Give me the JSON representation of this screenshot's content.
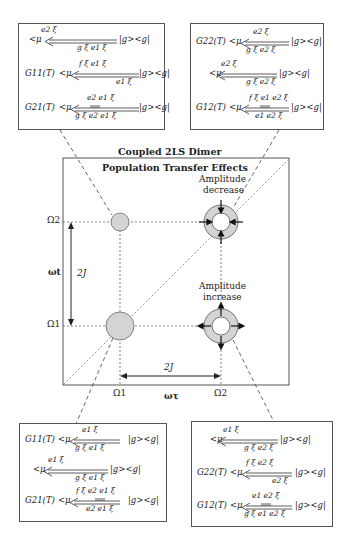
{
  "title": {
    "line1": "Coupled 2LS Dimer",
    "line2": "Population Transfer Effects"
  },
  "axes": {
    "x_label": "ωτ",
    "y_label": "ωt",
    "x_ticks": [
      "Ω1",
      "Ω2"
    ],
    "y_ticks": [
      "Ω1",
      "Ω2"
    ],
    "splitting_horizontal": "2J",
    "splitting_vertical": "2J"
  },
  "annotations": {
    "upper_right": [
      "Amplitude",
      "decrease"
    ],
    "lower_right": [
      "Amplitude",
      "increase"
    ]
  },
  "boxes": {
    "top_left": [
      {
        "prefix": "",
        "top": "e2 ξ",
        "bottom": "g ξ e1 ξ",
        "suffix": "|g><g|"
      },
      {
        "prefix": "G11(T)",
        "top": "f ξ e1 ξ",
        "bottom": "e1 ξ",
        "suffix": "|g><g|"
      },
      {
        "prefix": "G21(T)",
        "top": "e2  e1 ξ",
        "bottom": "g ξ e2  e1  ξ",
        "suffix": "|g><g|"
      }
    ],
    "top_right": [
      {
        "prefix": "G22(T)",
        "top": "e2 ξ",
        "bottom": "g ξ  e2 ξ",
        "suffix": "|g><g|"
      },
      {
        "prefix": "",
        "top": "e2 ξ",
        "bottom": "g ξ e2 ξ",
        "suffix": "|g><g|"
      },
      {
        "prefix": "G12(T)",
        "top": "f ξ e1  e2 ξ",
        "bottom": "e1  e2  ξ",
        "suffix": "|g><g|"
      }
    ],
    "bottom_left": [
      {
        "prefix": "G11(T)",
        "top": "e1 ξ",
        "bottom": "g ξ  e1  ξ",
        "suffix": "|g><g|"
      },
      {
        "prefix": "",
        "top": "e1 ξ",
        "bottom": "g ξ e1 ξ",
        "suffix": "|g><g|"
      },
      {
        "prefix": "G21(T)",
        "top": "f ξ e2  e1 ξ",
        "bottom": "e2  e1  ξ",
        "suffix": "|g><g|"
      }
    ],
    "bottom_right": [
      {
        "prefix": "",
        "top": "e1 ξ",
        "bottom": "g ξ e2 ξ",
        "suffix": "|g><g|"
      },
      {
        "prefix": "G22(T)",
        "top": "f ξ e2 ξ",
        "bottom": "e2 ξ",
        "suffix": "|g><g|"
      },
      {
        "prefix": "G12(T)",
        "top": "e1  e2 ξ",
        "bottom": "g ξ e1  e2  ξ",
        "suffix": "|g><g|"
      }
    ]
  },
  "mu_prefix": "<μ",
  "colors": {
    "stroke": "#333333",
    "fill_peak": "#d4d4d4",
    "dash": "#666666"
  }
}
